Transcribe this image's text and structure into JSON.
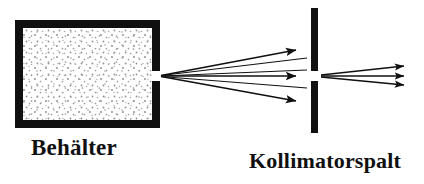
{
  "figure": {
    "kind": "physics-schematic",
    "title_visible": false,
    "background_color": "#ffffff",
    "ink_color": "#101010",
    "width": 424,
    "height": 184
  },
  "labels": {
    "container": "Behälter",
    "collimator": "Kollimatorspalt"
  },
  "components": {
    "container_box": {
      "name": "gas-container",
      "x": 15,
      "y": 20,
      "width": 145,
      "height": 108,
      "wall_thickness": 7,
      "wall_color": "#101010",
      "fill_color": "#ffffff",
      "texture": "stipple-dots",
      "texture_dot_color": "#8a8a8a",
      "aperture": {
        "side": "right",
        "y_top": 71,
        "y_bottom": 81
      }
    },
    "collimator_bar": {
      "name": "collimator-slit-plate",
      "x": 311,
      "y_top": 8,
      "y_bottom": 133,
      "thickness": 7,
      "color": "#101010",
      "slit": {
        "y_top": 71,
        "y_bottom": 81
      }
    }
  },
  "beams": {
    "divergent_fan": {
      "name": "divergent-molecular-beam",
      "origin_x": 161,
      "origin_y": 76,
      "end_x": 307,
      "ray_count": 6,
      "rays": [
        {
          "end_y": 50,
          "arrowhead": true
        },
        {
          "end_y": 58,
          "arrowhead": false
        },
        {
          "end_y": 70,
          "arrowhead": false
        },
        {
          "end_y": 76,
          "arrowhead": true
        },
        {
          "end_y": 88,
          "arrowhead": false
        },
        {
          "end_y": 101,
          "arrowhead": true
        }
      ]
    },
    "collimated_beam": {
      "name": "collimated-molecular-beam",
      "origin_x": 321,
      "origin_y": 76,
      "end_x": 414,
      "ray_count": 3,
      "rays": [
        {
          "end_y": 66,
          "arrowhead": true
        },
        {
          "end_y": 76,
          "arrowhead": true
        },
        {
          "end_y": 85,
          "arrowhead": true
        }
      ]
    }
  }
}
